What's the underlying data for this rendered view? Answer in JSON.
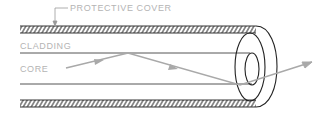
{
  "diagram": {
    "labels": {
      "protective_cover": "PROTECTIVE COVER",
      "cladding": "CLADDING",
      "core": "CORE"
    },
    "colors": {
      "line": "#333333",
      "label": "#b4b4b4",
      "ray": "#a9a9a9"
    }
  }
}
